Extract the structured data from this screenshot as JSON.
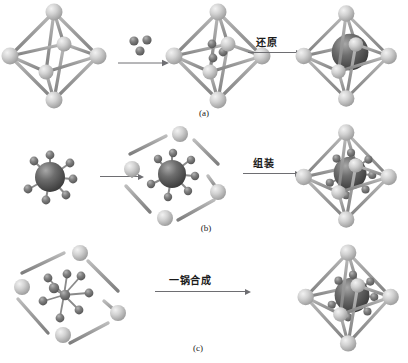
{
  "figure": {
    "caption_a": "(a)",
    "caption_b": "(b)",
    "caption_c": "(c)"
  },
  "rows": [
    {
      "id": "a",
      "label": "(a)",
      "arrow1_label": "",
      "arrow2_label": "还原",
      "steps": [
        "empty-octahedral-cage",
        "cage-with-guest-atoms",
        "cage-with-reduced-core"
      ]
    },
    {
      "id": "b",
      "label": "(b)",
      "arrow1_label": "",
      "arrow2_label": "组装",
      "steps": [
        "metal-complex",
        "disassembled-cage-with-complex",
        "assembled-cage-with-core"
      ]
    },
    {
      "id": "c",
      "label": "(c)",
      "arrow1_label": "一锅合成",
      "arrow2_label": "",
      "steps": [
        "scattered-precursors",
        "assembled-cage-with-core"
      ]
    }
  ],
  "colors": {
    "vertex_light": "#c9c9c9",
    "vertex_light_hi": "#eaeaea",
    "rod_gray": "#9a9a9a",
    "core_dark": "#5c5c5c",
    "core_dark_hi": "#8f8f8f",
    "ligand_dark": "#707070",
    "arrow": "#6e6e72",
    "text": "#1a1a1a",
    "background": "#ffffff"
  },
  "labels": {
    "reduction": "还原",
    "assembly": "组装",
    "one_pot_synthesis": "一锅合成"
  }
}
